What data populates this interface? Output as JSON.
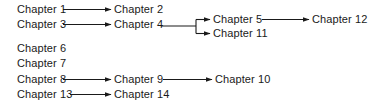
{
  "diagram": {
    "type": "flowchart",
    "title": "",
    "background_color": "#ffffff",
    "line_color": "#1a1a1a",
    "text_color": "#1a1a1a",
    "nodes": [
      {
        "id": "ch1",
        "label": "Chapter 1",
        "x": 17,
        "y": 9
      },
      {
        "id": "ch3",
        "label": "Chapter 3",
        "x": 17,
        "y": 24
      },
      {
        "id": "ch6",
        "label": "Chapter 6",
        "x": 17,
        "y": 48
      },
      {
        "id": "ch7",
        "label": "Chapter 7",
        "x": 17,
        "y": 63
      },
      {
        "id": "ch8",
        "label": "Chapter 8",
        "x": 17,
        "y": 79
      },
      {
        "id": "ch13",
        "label": "Chapter 13",
        "x": 17,
        "y": 94
      },
      {
        "id": "ch2",
        "label": "Chapter 2",
        "x": 114,
        "y": 9
      },
      {
        "id": "ch4",
        "label": "Chapter 4",
        "x": 114,
        "y": 24
      },
      {
        "id": "ch9",
        "label": "Chapter 9",
        "x": 114,
        "y": 79
      },
      {
        "id": "ch14",
        "label": "Chapter 14",
        "x": 114,
        "y": 94
      },
      {
        "id": "ch5",
        "label": "Chapter 5",
        "x": 213,
        "y": 19
      },
      {
        "id": "ch11",
        "label": "Chapter 11",
        "x": 213,
        "y": 33
      },
      {
        "id": "ch10",
        "label": "Chapter 10",
        "x": 215,
        "y": 79
      },
      {
        "id": "ch12",
        "label": "Chapter 12",
        "x": 312,
        "y": 19
      }
    ],
    "edges": [
      {
        "id": "e1",
        "from": "ch1",
        "to": "ch2",
        "arrow": true
      },
      {
        "id": "e2",
        "from": "ch3",
        "to": "ch4",
        "arrow": true
      },
      {
        "id": "e3",
        "from": "ch4",
        "to": "ch5",
        "arrow": true
      },
      {
        "id": "e4",
        "from": "ch4",
        "to": "ch11",
        "arrow": true
      },
      {
        "id": "e5",
        "from": "ch5",
        "to": "ch12",
        "arrow": true
      },
      {
        "id": "e6",
        "from": "ch8",
        "to": "ch9",
        "arrow": true
      },
      {
        "id": "e7",
        "from": "ch9",
        "to": "ch10",
        "arrow": true
      },
      {
        "id": "e8",
        "from": "ch13",
        "to": "ch14",
        "arrow": true
      }
    ],
    "isolated_nodes": [
      "ch6",
      "ch7"
    ]
  }
}
